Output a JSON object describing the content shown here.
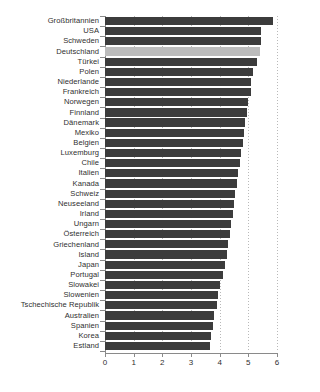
{
  "chart_data": {
    "type": "bar",
    "orientation": "horizontal",
    "title": "",
    "subtitle": "",
    "xlabel": "",
    "ylabel": "",
    "xlim": [
      0,
      6
    ],
    "xticks": [
      0,
      1,
      2,
      3,
      4,
      5,
      6
    ],
    "xtick_labels": [
      "0",
      "1",
      "2",
      "3",
      "4",
      "5",
      "6"
    ],
    "grid": "vertical dotted gridlines at each integer tick",
    "legend": "none",
    "highlight_category": "Deutschland",
    "colors": {
      "bar": "#3c3c3c",
      "bar_highlight": "#bcbcbc",
      "axis": "#8a8a8a",
      "gridline": "#b9b9b9",
      "text": "#2f2f2f",
      "background": "#ffffff"
    },
    "categories": [
      "Großbritannien",
      "USA",
      "Schweden",
      "Deutschland",
      "Türkei",
      "Polen",
      "Niederlande",
      "Frankreich",
      "Norwegen",
      "Finnland",
      "Dänemark",
      "Mexiko",
      "Belgien",
      "Luxemburg",
      "Chile",
      "Italien",
      "Kanada",
      "Schweiz",
      "Neuseeland",
      "Irland",
      "Ungarn",
      "Österreich",
      "Griechenland",
      "Island",
      "Japan",
      "Portugal",
      "Slowakei",
      "Slowenien",
      "Tschechische Republik",
      "Australien",
      "Spanien",
      "Korea",
      "Estland"
    ],
    "values": [
      5.85,
      5.45,
      5.45,
      5.4,
      5.3,
      5.15,
      5.1,
      5.1,
      5.0,
      4.95,
      4.9,
      4.85,
      4.8,
      4.75,
      4.7,
      4.65,
      4.6,
      4.55,
      4.5,
      4.45,
      4.4,
      4.35,
      4.3,
      4.25,
      4.2,
      4.1,
      4.0,
      3.95,
      3.9,
      3.8,
      3.75,
      3.7,
      3.65
    ]
  },
  "source_note": ""
}
